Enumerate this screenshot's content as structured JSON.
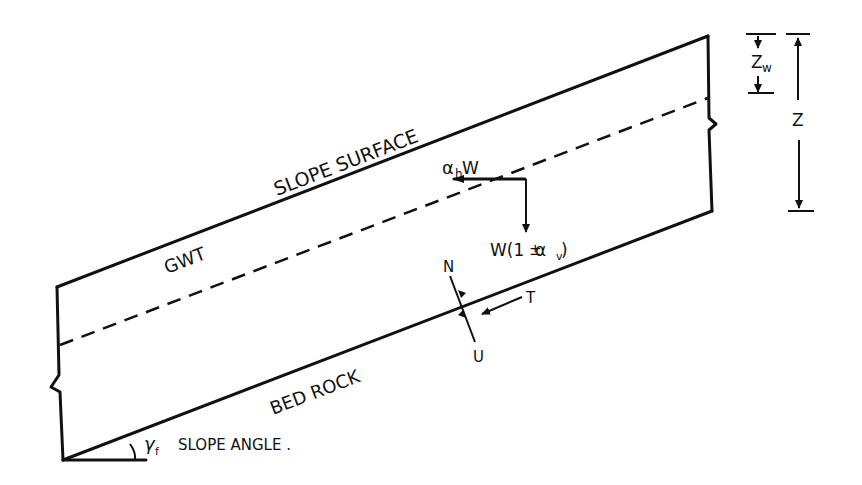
{
  "diagram": {
    "type": "infinite-slope-free-body-diagram",
    "labels": {
      "slope_surface": "SLOPE SURFACE",
      "gwt": "GWT",
      "bed_rock": "BED ROCK",
      "slope_angle": "SLOPE ANGLE .",
      "slope_angle_symbol": "γ",
      "slope_angle_subscript": "f",
      "horizontal_force": "α",
      "horizontal_force_subscript": "h",
      "horizontal_force_suffix": " W",
      "vertical_force_prefix": "W(1",
      "vertical_force_pm": "±",
      "vertical_force_alpha": " α",
      "vertical_force_subscript": "v",
      "vertical_force_close": " )",
      "normal_force": "N",
      "shear_force": "T",
      "pore_pressure": "U",
      "depth": "Z",
      "water_depth": "Z",
      "water_depth_subscript": "w"
    },
    "colors": {
      "ink": "#111111",
      "background": "#ffffff"
    }
  }
}
